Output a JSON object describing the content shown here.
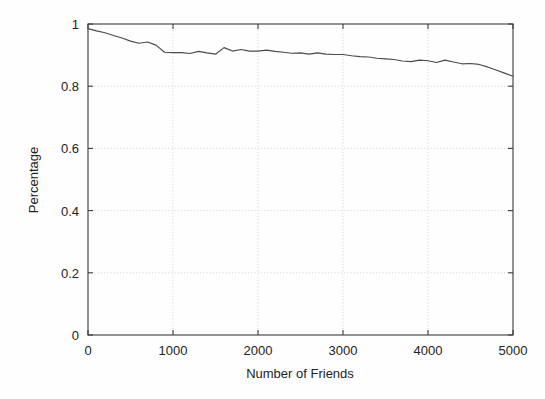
{
  "chart_data": {
    "type": "line",
    "title": "",
    "subtitle": "",
    "xlabel": "Number of Friends",
    "ylabel": "Percentage",
    "xlim": [
      0,
      5000
    ],
    "ylim": [
      0,
      1
    ],
    "grid": true,
    "legend": null,
    "legend_position": "none",
    "xticks": [
      0,
      1000,
      2000,
      3000,
      4000,
      5000
    ],
    "xtick_labels": [
      "0",
      "1000",
      "2000",
      "3000",
      "4000",
      "5000"
    ],
    "yticks": [
      0,
      0.2,
      0.4,
      0.6,
      0.8,
      1
    ],
    "ytick_labels": [
      "0",
      "0.2",
      "0.4",
      "0.6",
      "0.8",
      "1"
    ],
    "series": [
      {
        "name": "percentage",
        "color": "#4a4a4a",
        "x": [
          0,
          100,
          200,
          300,
          400,
          500,
          600,
          700,
          800,
          900,
          1000,
          1100,
          1200,
          1300,
          1400,
          1500,
          1600,
          1700,
          1800,
          1900,
          2000,
          2100,
          2200,
          2300,
          2400,
          2500,
          2600,
          2700,
          2800,
          2900,
          3000,
          3100,
          3200,
          3300,
          3400,
          3500,
          3600,
          3700,
          3800,
          3900,
          4000,
          4100,
          4200,
          4300,
          4400,
          4500,
          4600,
          4700,
          4800,
          4900,
          5000
        ],
        "y": [
          0.985,
          0.978,
          0.972,
          0.963,
          0.955,
          0.945,
          0.938,
          0.942,
          0.932,
          0.909,
          0.908,
          0.908,
          0.905,
          0.912,
          0.907,
          0.903,
          0.924,
          0.913,
          0.918,
          0.913,
          0.913,
          0.916,
          0.912,
          0.909,
          0.906,
          0.907,
          0.903,
          0.907,
          0.903,
          0.902,
          0.902,
          0.898,
          0.895,
          0.894,
          0.89,
          0.888,
          0.886,
          0.881,
          0.879,
          0.884,
          0.882,
          0.876,
          0.884,
          0.878,
          0.872,
          0.873,
          0.87,
          0.862,
          0.852,
          0.842,
          0.832
        ]
      }
    ]
  },
  "axes": {
    "x_title": "Number of Friends",
    "y_title": "Percentage"
  }
}
